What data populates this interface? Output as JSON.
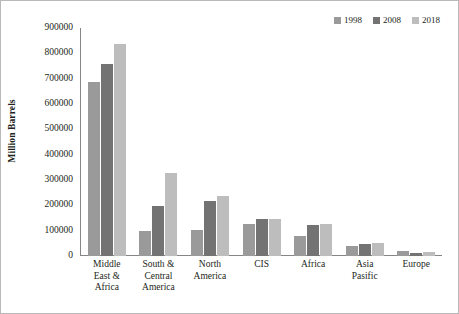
{
  "chart_data": {
    "type": "bar",
    "title": "",
    "subtitle": "",
    "xlabel": "",
    "ylabel": "Million Barrels",
    "ylim": [
      0,
      900000
    ],
    "ytick_labels": [
      "900000",
      "800000",
      "700000",
      "600000",
      "500000",
      "400000",
      "300000",
      "200000",
      "100000",
      "0"
    ],
    "ytick_values": [
      900000,
      800000,
      700000,
      600000,
      500000,
      400000,
      300000,
      200000,
      100000,
      0
    ],
    "grid": false,
    "legend_position": "top-right",
    "categories": [
      [
        "Middle",
        "East &",
        "Africa"
      ],
      [
        "South &",
        "Central",
        "America"
      ],
      [
        "North",
        "America"
      ],
      [
        "CIS"
      ],
      [
        "Africa"
      ],
      [
        "Asia",
        "Pasific"
      ],
      [
        "Europe"
      ]
    ],
    "category_names": [
      "Middle East & Africa",
      "South & Central America",
      "North America",
      "CIS",
      "Africa",
      "Asia Pasific",
      "Europe"
    ],
    "series": [
      {
        "name": "1998",
        "color": "#9a9a9a",
        "values": [
          688000,
          98000,
          103000,
          125000,
          80000,
          41000,
          21000
        ]
      },
      {
        "name": "2008",
        "color": "#737373",
        "values": [
          757000,
          198000,
          219000,
          147000,
          124000,
          49000,
          13000
        ]
      },
      {
        "name": "2018",
        "color": "#bdbdbd",
        "values": [
          836000,
          326000,
          238000,
          148000,
          126000,
          50000,
          14000
        ]
      }
    ]
  },
  "legend": {
    "entries": [
      {
        "label": "1998",
        "color": "#9a9a9a"
      },
      {
        "label": "2008",
        "color": "#737373"
      },
      {
        "label": "2018",
        "color": "#bdbdbd"
      }
    ]
  },
  "axes": {
    "y_title": "Million Barrels",
    "axis_line_color": "#868686"
  }
}
